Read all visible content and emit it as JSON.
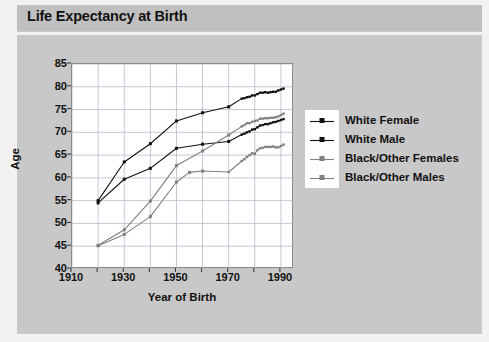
{
  "header": {
    "title": "Life Expectancy at Birth"
  },
  "chart_data": {
    "type": "line",
    "title": "Life Expectancy at Birth",
    "xlabel": "Year of Birth",
    "ylabel": "Age",
    "xlim": [
      1910,
      1995
    ],
    "ylim": [
      40,
      85
    ],
    "ytick_values": [
      40,
      45,
      50,
      55,
      60,
      65,
      70,
      75,
      80,
      85
    ],
    "ytick_labels": [
      "40",
      "45",
      "50",
      "55",
      "60",
      "65",
      "70",
      "75",
      "80",
      "85"
    ],
    "xtick_values": [
      1910,
      1930,
      1950,
      1970,
      1990
    ],
    "xtick_labels": [
      "1910",
      "1930",
      "1950",
      "1970",
      "1990"
    ],
    "xminor_values": [
      1920,
      1940,
      1960,
      1980
    ],
    "grid": true,
    "legend_position": "right",
    "series": [
      {
        "name": "White Female",
        "color": "#111111",
        "marker": "square",
        "points": [
          [
            1920,
            55.0
          ],
          [
            1930,
            63.5
          ],
          [
            1940,
            67.5
          ],
          [
            1950,
            72.5
          ],
          [
            1960,
            74.3
          ],
          [
            1970,
            75.6
          ],
          [
            1975,
            77.4
          ],
          [
            1976,
            77.5
          ],
          [
            1977,
            77.7
          ],
          [
            1978,
            77.8
          ],
          [
            1979,
            78.1
          ],
          [
            1980,
            78.1
          ],
          [
            1981,
            78.4
          ],
          [
            1982,
            78.7
          ],
          [
            1983,
            78.7
          ],
          [
            1984,
            78.8
          ],
          [
            1985,
            78.7
          ],
          [
            1986,
            78.8
          ],
          [
            1987,
            78.9
          ],
          [
            1988,
            78.9
          ],
          [
            1989,
            79.2
          ],
          [
            1990,
            79.4
          ],
          [
            1991,
            79.6
          ]
        ]
      },
      {
        "name": "White Male",
        "color": "#111111",
        "marker": "square",
        "points": [
          [
            1920,
            54.5
          ],
          [
            1930,
            59.7
          ],
          [
            1940,
            62.1
          ],
          [
            1950,
            66.5
          ],
          [
            1960,
            67.4
          ],
          [
            1970,
            68.0
          ],
          [
            1975,
            69.5
          ],
          [
            1976,
            69.7
          ],
          [
            1977,
            70.0
          ],
          [
            1978,
            70.2
          ],
          [
            1979,
            70.6
          ],
          [
            1980,
            70.7
          ],
          [
            1981,
            71.1
          ],
          [
            1982,
            71.5
          ],
          [
            1983,
            71.6
          ],
          [
            1984,
            71.8
          ],
          [
            1985,
            71.8
          ],
          [
            1986,
            72.0
          ],
          [
            1987,
            72.2
          ],
          [
            1988,
            72.3
          ],
          [
            1989,
            72.5
          ],
          [
            1990,
            72.7
          ],
          [
            1991,
            72.9
          ]
        ]
      },
      {
        "name": "Black/Other Females",
        "color": "#808080",
        "marker": "square",
        "points": [
          [
            1920,
            45.2
          ],
          [
            1930,
            48.6
          ],
          [
            1940,
            54.9
          ],
          [
            1950,
            62.7
          ],
          [
            1960,
            65.9
          ],
          [
            1970,
            69.4
          ],
          [
            1975,
            71.3
          ],
          [
            1976,
            71.6
          ],
          [
            1977,
            72.0
          ],
          [
            1978,
            72.0
          ],
          [
            1979,
            72.3
          ],
          [
            1980,
            72.5
          ],
          [
            1981,
            72.6
          ],
          [
            1982,
            73.0
          ],
          [
            1983,
            73.0
          ],
          [
            1984,
            73.1
          ],
          [
            1985,
            73.1
          ],
          [
            1986,
            73.2
          ],
          [
            1987,
            73.2
          ],
          [
            1988,
            73.3
          ],
          [
            1989,
            73.5
          ],
          [
            1990,
            73.8
          ],
          [
            1991,
            74.1
          ]
        ]
      },
      {
        "name": "Black/Other Males",
        "color": "#808080",
        "marker": "square",
        "points": [
          [
            1920,
            45.1
          ],
          [
            1930,
            47.6
          ],
          [
            1940,
            51.5
          ],
          [
            1950,
            59.1
          ],
          [
            1955,
            61.2
          ],
          [
            1960,
            61.5
          ],
          [
            1970,
            61.3
          ],
          [
            1975,
            63.7
          ],
          [
            1976,
            64.1
          ],
          [
            1977,
            64.6
          ],
          [
            1978,
            65.0
          ],
          [
            1979,
            65.4
          ],
          [
            1980,
            65.3
          ],
          [
            1981,
            66.1
          ],
          [
            1982,
            66.5
          ],
          [
            1983,
            66.6
          ],
          [
            1984,
            66.8
          ],
          [
            1985,
            66.8
          ],
          [
            1986,
            66.8
          ],
          [
            1987,
            66.9
          ],
          [
            1988,
            66.7
          ],
          [
            1989,
            66.7
          ],
          [
            1990,
            67.0
          ],
          [
            1991,
            67.3
          ]
        ]
      }
    ]
  },
  "legend": {
    "items": [
      {
        "label": "White Female",
        "color": "#111111"
      },
      {
        "label": "White Male",
        "color": "#111111"
      },
      {
        "label": "Black/Other Females",
        "color": "#808080"
      },
      {
        "label": "Black/Other Males",
        "color": "#808080"
      }
    ]
  }
}
